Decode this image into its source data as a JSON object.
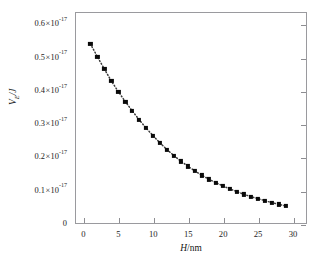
{
  "figure": {
    "top_clipped_text": "· ·· ·· ·· · ·· ···",
    "background_color": "#ffffff",
    "frame_color": "#9a9a9e",
    "marker_color": "#0a0a0a",
    "line_color": "#3a3a3a"
  },
  "chart_data": {
    "type": "scatter",
    "title": "",
    "subtitle": "",
    "xlabel": "H/nm",
    "xlabel_parts": {
      "symbol": "H",
      "separator": "/",
      "unit": "nm"
    },
    "ylabel": "V_E/J",
    "ylabel_parts": {
      "symbol": "V",
      "subscript": "E",
      "separator": "/",
      "unit": "J"
    },
    "xlim": [
      -1.2,
      32.0
    ],
    "ylim": [
      0,
      0.6375
    ],
    "y_scale_factor": "1e-17",
    "grid": false,
    "legend": null,
    "xticks": [
      0,
      5,
      10,
      15,
      20,
      25,
      30
    ],
    "xticklabels": [
      "0",
      "5",
      "10",
      "15",
      "20",
      "25",
      "30"
    ],
    "yticks": [
      0,
      0.1,
      0.2,
      0.3,
      0.4,
      0.5,
      0.6
    ],
    "yticklabels": [
      {
        "mantissa": "0",
        "times": "",
        "base": "",
        "exponent": ""
      },
      {
        "mantissa": "0.1",
        "times": "×",
        "base": "10",
        "exponent": "-17"
      },
      {
        "mantissa": "0.2",
        "times": "×",
        "base": "10",
        "exponent": "-17"
      },
      {
        "mantissa": "0.3",
        "times": "×",
        "base": "10",
        "exponent": "-17"
      },
      {
        "mantissa": "0.4",
        "times": "×",
        "base": "10",
        "exponent": "-17"
      },
      {
        "mantissa": "0.5",
        "times": "×",
        "base": "10",
        "exponent": "-17"
      },
      {
        "mantissa": "0.6",
        "times": "×",
        "base": "10",
        "exponent": "-17"
      }
    ],
    "marker_style": "filled-square",
    "line_style": "dotted",
    "series": [
      {
        "name": "V_E vs H",
        "x": [
          1.0,
          2.0,
          3.0,
          4.0,
          5.0,
          6.0,
          7.0,
          8.0,
          9.0,
          10.0,
          11.0,
          12.0,
          13.0,
          14.0,
          15.0,
          16.0,
          17.0,
          18.0,
          19.0,
          20.0,
          21.0,
          22.0,
          23.0,
          24.0,
          25.0,
          26.0,
          27.0,
          28.0,
          29.0
        ],
        "y": [
          0.542,
          0.503,
          0.466,
          0.43,
          0.398,
          0.368,
          0.34,
          0.313,
          0.288,
          0.265,
          0.243,
          0.223,
          0.205,
          0.188,
          0.173,
          0.159,
          0.146,
          0.134,
          0.124,
          0.114,
          0.105,
          0.097,
          0.089,
          0.082,
          0.076,
          0.07,
          0.064,
          0.059,
          0.054
        ]
      }
    ]
  }
}
